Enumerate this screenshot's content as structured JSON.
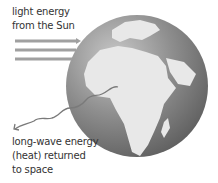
{
  "diagram": {
    "labels": {
      "incoming_line1": "light energy",
      "incoming_line2": "from the Sun",
      "outgoing_line1": "long-wave energy",
      "outgoing_line2": "(heat) returned",
      "outgoing_line3": "to space"
    },
    "elements": {
      "globe": "Earth showing Africa, Europe and the Middle East",
      "incoming_arrows": 3,
      "outgoing_arrow": "wavy line"
    },
    "colors": {
      "arrow": "#9a9a9a",
      "ocean_dark": "#6e6e6e",
      "land": "#e6e6e6",
      "text": "#333333"
    }
  }
}
